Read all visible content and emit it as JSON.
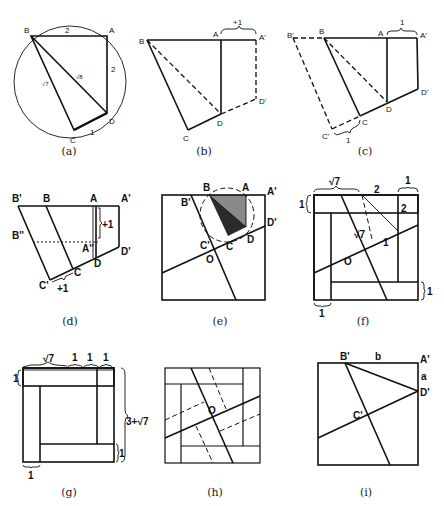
{
  "figure": {
    "panels": [
      {
        "id": "a",
        "caption": "(a)",
        "labels": {
          "B": "B",
          "A": "A",
          "C": "C",
          "D": "D",
          "top": "2",
          "right": "2",
          "bottom": "1",
          "diag1": "√8",
          "diag2": "√7"
        }
      },
      {
        "id": "b",
        "caption": "(b)",
        "labels": {
          "B": "B",
          "A": "A",
          "A2": "A'",
          "C": "C",
          "D": "D",
          "D2": "D'",
          "brace": "+1"
        }
      },
      {
        "id": "c",
        "caption": "(c)",
        "labels": {
          "B2": "B'",
          "B": "B",
          "A": "A",
          "A2": "A'",
          "C": "C",
          "C2": "C'",
          "D": "D",
          "D2": "D'",
          "brace_top": "1",
          "brace_bottom": "1"
        }
      },
      {
        "id": "d",
        "caption": "(d)",
        "labels": {
          "B2": "B'",
          "B": "B",
          "A": "A",
          "A2": "A'",
          "B3": "B''",
          "A3": "A''",
          "C": "C",
          "C2": "C'",
          "D": "D",
          "D2": "D'",
          "plus_right": "+1",
          "plus_bottom": "+1"
        }
      },
      {
        "id": "e",
        "caption": "(e)",
        "labels": {
          "B": "B",
          "B2": "B'",
          "A": "A",
          "A2": "A'",
          "C": "C",
          "C2": "C'",
          "D": "D",
          "D2": "D'",
          "O": "O"
        }
      },
      {
        "id": "f",
        "caption": "(f)",
        "labels": {
          "sqrt7_top": "√7",
          "two_top": "2",
          "one_topright": "1",
          "one_left": "1",
          "two_right": "2",
          "sqrt7_mid": "√7",
          "one_mid": "1",
          "O": "O",
          "one_right": "1",
          "one_bottom": "1"
        }
      },
      {
        "id": "g",
        "caption": "(g)",
        "labels": {
          "sqrt7": "√7",
          "one_a": "1",
          "one_b": "1",
          "one_c": "1",
          "one_left": "1",
          "total": "3+√7",
          "one_right": "1",
          "one_bottom": "1"
        }
      },
      {
        "id": "h",
        "caption": "(h)",
        "labels": {
          "O": "O"
        }
      },
      {
        "id": "i",
        "caption": "(i)",
        "labels": {
          "B2": "B'",
          "b": "b",
          "A2": "A'",
          "a": "a",
          "D2": "D'",
          "C2": "C'"
        }
      }
    ]
  }
}
